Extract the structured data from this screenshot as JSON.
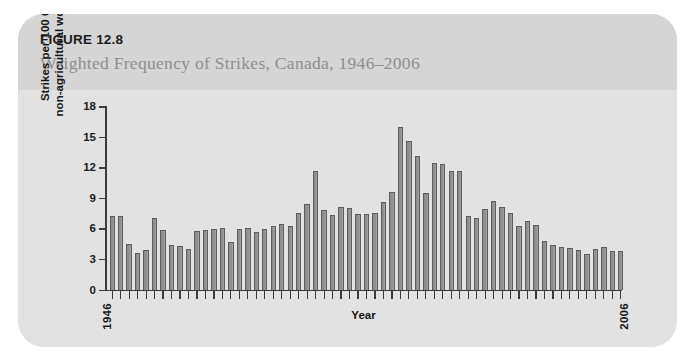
{
  "figure": {
    "number": "FIGURE 12.8",
    "title": "Weighted Frequency of Strikes, Canada, 1946–2006"
  },
  "axes": {
    "x_title": "Year",
    "y_title": "Strikes per 100 000\nnon-agricultural workers",
    "x_start_label": "1946",
    "x_end_label": "2006",
    "y_ticks": [
      "0",
      "3",
      "6",
      "9",
      "12",
      "15",
      "18"
    ]
  },
  "colors": {
    "card_background": "#e2e2e2",
    "header_band": "#d5d5d5",
    "bar_fill": "#8e8e8e",
    "bar_stroke": "#5d5d5d",
    "axis": "#3b3b3b",
    "title_text": "#8e8e8e",
    "figure_number_text": "#1b1b1b",
    "page_background": "#ffffff"
  },
  "chart_data": {
    "type": "bar",
    "title": "Weighted Frequency of Strikes, Canada, 1946–2006",
    "xlabel": "Year",
    "ylabel": "Strikes per 100 000 non-agricultural workers",
    "ylim": [
      0,
      18
    ],
    "yticks": [
      0,
      3,
      6,
      9,
      12,
      15,
      18
    ],
    "grid": false,
    "legend": null,
    "categories": [
      "1946",
      "1947",
      "1948",
      "1949",
      "1950",
      "1951",
      "1952",
      "1953",
      "1954",
      "1955",
      "1956",
      "1957",
      "1958",
      "1959",
      "1960",
      "1961",
      "1962",
      "1963",
      "1964",
      "1965",
      "1966",
      "1967",
      "1968",
      "1969",
      "1970",
      "1971",
      "1972",
      "1973",
      "1974",
      "1975",
      "1976",
      "1977",
      "1978",
      "1979",
      "1980",
      "1981",
      "1982",
      "1983",
      "1984",
      "1985",
      "1986",
      "1987",
      "1988",
      "1989",
      "1990",
      "1991",
      "1992",
      "1993",
      "1994",
      "1995",
      "1996",
      "1997",
      "1998",
      "1999",
      "2000",
      "2001",
      "2002",
      "2003",
      "2004",
      "2005",
      "2006"
    ],
    "values": [
      7.2,
      7.2,
      4.5,
      3.6,
      3.9,
      7.0,
      5.8,
      4.4,
      4.3,
      4.0,
      5.7,
      5.8,
      5.9,
      6.0,
      4.7,
      5.9,
      6.0,
      5.6,
      5.9,
      6.2,
      6.4,
      6.2,
      7.5,
      8.4,
      11.6,
      7.8,
      7.3,
      8.1,
      8.0,
      7.4,
      7.4,
      7.5,
      8.6,
      9.6,
      15.9,
      14.6,
      13.1,
      9.5,
      12.4,
      12.3,
      11.6,
      11.6,
      7.2,
      7.0,
      7.9,
      8.7,
      8.1,
      7.5,
      6.2,
      6.7,
      6.3,
      4.8,
      4.4,
      4.2,
      4.1,
      3.9,
      3.5,
      4.0,
      4.2,
      3.8,
      3.8
    ]
  }
}
